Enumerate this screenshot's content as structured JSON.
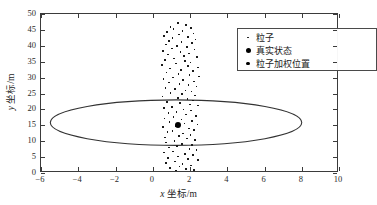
{
  "chart_data": {
    "type": "scatter",
    "title": "",
    "xlabel": "x 坐标/m",
    "ylabel": "y 坐标/m",
    "xlim": [
      -6,
      10
    ],
    "ylim": [
      0,
      50
    ],
    "xticks": [
      -6,
      -4,
      -2,
      0,
      2,
      4,
      6,
      8,
      10
    ],
    "yticks": [
      0,
      5,
      10,
      15,
      20,
      25,
      30,
      35,
      40,
      45,
      50
    ],
    "grid": false,
    "legend_position": "top-right",
    "legend": [
      {
        "label": "粒子",
        "marker": "small-dot",
        "color": "#111111"
      },
      {
        "label": "真实状态",
        "marker": "large-dot",
        "color": "#000000"
      },
      {
        "label": "粒子加权位置",
        "marker": "medium-dot",
        "color": "#000000"
      }
    ],
    "series": [
      {
        "name": "粒子",
        "marker": "small-dot",
        "points": [
          [
            1.35,
            47.1
          ],
          [
            1.78,
            46.6
          ],
          [
            0.95,
            46.0
          ],
          [
            2.05,
            45.6
          ],
          [
            1.12,
            45.2
          ],
          [
            1.6,
            44.7
          ],
          [
            0.78,
            44.3
          ],
          [
            2.18,
            43.9
          ],
          [
            1.42,
            43.5
          ],
          [
            0.62,
            43.1
          ],
          [
            1.9,
            42.8
          ],
          [
            1.05,
            42.4
          ],
          [
            2.3,
            42.0
          ],
          [
            0.88,
            41.6
          ],
          [
            1.55,
            41.2
          ],
          [
            2.12,
            40.8
          ],
          [
            0.7,
            40.4
          ],
          [
            1.3,
            40.0
          ],
          [
            1.85,
            39.6
          ],
          [
            1.02,
            39.2
          ],
          [
            2.25,
            38.8
          ],
          [
            0.55,
            38.4
          ],
          [
            1.48,
            38.0
          ],
          [
            1.95,
            37.6
          ],
          [
            0.82,
            37.2
          ],
          [
            1.68,
            36.8
          ],
          [
            2.38,
            36.4
          ],
          [
            1.15,
            36.0
          ],
          [
            0.66,
            35.6
          ],
          [
            1.72,
            35.2
          ],
          [
            2.02,
            34.8
          ],
          [
            1.25,
            34.4
          ],
          [
            0.5,
            34.0
          ],
          [
            1.88,
            33.6
          ],
          [
            2.42,
            33.2
          ],
          [
            0.92,
            32.8
          ],
          [
            1.52,
            32.4
          ],
          [
            2.15,
            32.0
          ],
          [
            0.74,
            31.6
          ],
          [
            1.38,
            31.2
          ],
          [
            1.98,
            30.8
          ],
          [
            2.48,
            30.4
          ],
          [
            1.08,
            30.0
          ],
          [
            0.58,
            29.6
          ],
          [
            1.62,
            29.2
          ],
          [
            2.22,
            28.8
          ],
          [
            0.86,
            28.4
          ],
          [
            1.44,
            28.0
          ],
          [
            1.92,
            27.6
          ],
          [
            2.35,
            27.2
          ],
          [
            0.68,
            26.8
          ],
          [
            1.2,
            26.4
          ],
          [
            1.76,
            26.0
          ],
          [
            2.08,
            25.6
          ],
          [
            0.95,
            25.2
          ],
          [
            1.58,
            24.8
          ],
          [
            2.28,
            24.4
          ],
          [
            0.52,
            24.0
          ],
          [
            1.34,
            23.6
          ],
          [
            1.86,
            23.2
          ],
          [
            2.16,
            22.8
          ],
          [
            0.78,
            22.4
          ],
          [
            1.46,
            22.0
          ],
          [
            1.99,
            21.6
          ],
          [
            2.44,
            21.2
          ],
          [
            1.04,
            20.8
          ],
          [
            0.6,
            20.4
          ],
          [
            1.66,
            20.0
          ],
          [
            2.05,
            19.6
          ],
          [
            1.28,
            19.2
          ],
          [
            0.84,
            18.8
          ],
          [
            1.8,
            18.4
          ],
          [
            2.32,
            18.0
          ],
          [
            1.12,
            17.6
          ],
          [
            0.64,
            17.2
          ],
          [
            1.54,
            16.8
          ],
          [
            2.12,
            16.4
          ],
          [
            0.9,
            16.0
          ],
          [
            1.7,
            15.6
          ],
          [
            2.4,
            15.2
          ],
          [
            1.22,
            14.8
          ],
          [
            0.56,
            14.4
          ],
          [
            1.94,
            14.0
          ],
          [
            2.2,
            13.6
          ],
          [
            1.06,
            13.2
          ],
          [
            0.8,
            12.8
          ],
          [
            1.62,
            12.4
          ],
          [
            2.02,
            12.0
          ],
          [
            1.4,
            11.6
          ],
          [
            0.66,
            11.2
          ],
          [
            1.84,
            10.8
          ],
          [
            2.26,
            10.4
          ],
          [
            1.16,
            10.0
          ],
          [
            0.72,
            9.6
          ],
          [
            1.56,
            9.2
          ],
          [
            2.1,
            8.8
          ],
          [
            1.3,
            8.4
          ],
          [
            0.88,
            8.0
          ],
          [
            1.98,
            7.6
          ],
          [
            2.34,
            7.2
          ],
          [
            1.1,
            6.8
          ],
          [
            0.6,
            6.4
          ],
          [
            1.72,
            6.0
          ],
          [
            2.16,
            5.6
          ],
          [
            1.36,
            5.2
          ],
          [
            0.82,
            4.8
          ],
          [
            1.9,
            4.4
          ],
          [
            2.44,
            4.0
          ],
          [
            1.18,
            3.6
          ],
          [
            0.7,
            3.2
          ],
          [
            1.6,
            2.8
          ],
          [
            2.06,
            2.4
          ],
          [
            1.44,
            2.0
          ],
          [
            0.92,
            1.6
          ],
          [
            1.78,
            1.2
          ],
          [
            2.22,
            0.9
          ],
          [
            1.24,
            0.7
          ],
          [
            0.76,
            0.5
          ],
          [
            1.66,
            0.4
          ],
          [
            2.0,
            0.3
          ],
          [
            1.5,
            0.2
          ],
          [
            1.02,
            0.15
          ],
          [
            1.86,
            0.12
          ],
          [
            0.65,
            0.1
          ],
          [
            2.3,
            0.1
          ]
        ]
      }
    ],
    "truth_point": {
      "name": "真实状态",
      "x": 1.38,
      "y": 15.1
    },
    "weighted_point": {
      "name": "粒子加权位置",
      "x": 1.38,
      "y": 15.1
    },
    "ellipse": {
      "name": "不确定椭圆",
      "center_x": 1.25,
      "center_y": 15.85,
      "semi_axis_x": 6.75,
      "semi_axis_y": 7.15,
      "stroke": "#333333"
    }
  }
}
